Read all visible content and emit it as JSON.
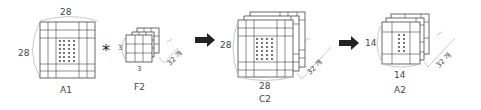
{
  "diagram": {
    "stages": [
      {
        "id": "A1",
        "label": "A1",
        "width_label": "28",
        "height_label": "28",
        "kind": "input-map"
      },
      {
        "id": "F2",
        "label": "F2",
        "width_label": "3",
        "height_label": "3",
        "depth_label": "32 개",
        "kind": "filters"
      },
      {
        "id": "C2",
        "label": "C2",
        "width_label": "28",
        "height_label": "28",
        "depth_label": "32 개",
        "kind": "conv-output"
      },
      {
        "id": "A2",
        "label": "A2",
        "width_label": "14",
        "height_label": "14",
        "depth_label": "32 개",
        "kind": "pooled-output"
      }
    ],
    "operators": {
      "convolution": "*",
      "arrow_1": "right-arrow",
      "arrow_2": "right-arrow"
    },
    "ellipsis": "...",
    "colors": {
      "stroke": "#444444",
      "brace": "#bbbbbb",
      "arrow": "#222222",
      "background": "#ffffff"
    }
  }
}
